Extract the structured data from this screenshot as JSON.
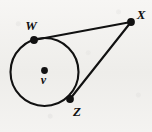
{
  "figure": {
    "width": 152,
    "height": 132,
    "background_color": "#f3f2f0",
    "ink_color": "#111111"
  },
  "geometry": {
    "circle": {
      "center_label": "V",
      "center_x": 44.5,
      "center_y": 72,
      "radius": 34,
      "stroke_width": 2.1
    },
    "points": [
      {
        "id": "v",
        "label": "v",
        "x": 44.5,
        "y": 70.5,
        "dot_radius": 3.4,
        "label_x": 43.5,
        "label_y": 84,
        "label_size": 12,
        "is_center": true
      },
      {
        "id": "w",
        "label": "W",
        "x": 34,
        "y": 40,
        "dot_radius": 3.9,
        "label_x": 31,
        "label_y": 30,
        "label_size": 13,
        "is_center": false
      },
      {
        "id": "x",
        "label": "X",
        "x": 131,
        "y": 22,
        "dot_radius": 3.9,
        "label_x": 141,
        "label_y": 19,
        "label_size": 13,
        "is_center": false
      },
      {
        "id": "z",
        "label": "Z",
        "x": 70,
        "y": 99,
        "dot_radius": 3.9,
        "label_x": 77,
        "label_y": 116,
        "label_size": 13,
        "is_center": false
      }
    ],
    "segments": [
      {
        "id": "wx",
        "from": "W",
        "to": "X",
        "x1": 34,
        "y1": 40,
        "x2": 131,
        "y2": 22,
        "stroke_width": 2.1
      },
      {
        "id": "zx",
        "from": "Z",
        "to": "X",
        "x1": 70,
        "y1": 99,
        "x2": 131,
        "y2": 22,
        "stroke_width": 2.1
      }
    ]
  }
}
